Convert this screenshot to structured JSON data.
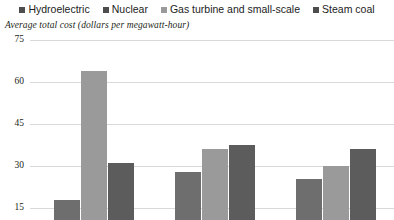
{
  "legend": {
    "items": [
      {
        "label": "Hydroelectric",
        "color": "#4d4d4d",
        "icon": "square-marker-icon"
      },
      {
        "label": "Nuclear",
        "color": "#4d4d4d",
        "icon": "square-marker-icon"
      },
      {
        "label": "Gas turbine and small-scale",
        "color": "#9a9a9a",
        "icon": "square-marker-icon"
      },
      {
        "label": "Steam coal",
        "color": "#4d4d4d",
        "icon": "square-marker-icon"
      }
    ]
  },
  "subtitle": "Average total cost (dollars per megawatt-hour)",
  "chart_data": {
    "type": "bar",
    "title": "",
    "subtitle": "Average total cost (dollars per megawatt-hour)",
    "xlabel": "",
    "ylabel": "Average total cost (dollars per megawatt-hour)",
    "ylim": [
      0,
      75
    ],
    "yticks": [
      15,
      30,
      45,
      60,
      75
    ],
    "ytick_labels": [
      "15",
      "30",
      "45",
      "60",
      "75"
    ],
    "grid": true,
    "legend_position": "top",
    "categories": [
      "Group 1",
      "Group 2",
      "Group 3"
    ],
    "series": [
      {
        "name": "Nuclear",
        "color": "#6e6e6e",
        "values": [
          18,
          28,
          25.5
        ]
      },
      {
        "name": "Gas turbine and small-scale",
        "color": "#9a9a9a",
        "values": [
          64,
          36,
          30
        ]
      },
      {
        "name": "Steam coal",
        "color": "#5c5c5c",
        "values": [
          31,
          37.5,
          36
        ]
      }
    ],
    "note": "Chart is cropped; x-axis category labels are below the visible area."
  },
  "colors": {
    "gridline": "#d9d9d9",
    "text": "#231f20",
    "bar_dark": "#6e6e6e",
    "bar_light": "#9a9a9a",
    "bar_darker": "#5c5c5c",
    "background": "#ffffff"
  }
}
